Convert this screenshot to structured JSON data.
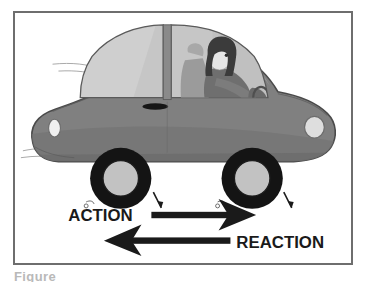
{
  "figure": {
    "caption_partial": "Figure",
    "frame": {
      "border_color": "#6e6e6e",
      "background_color": "#ffffff"
    }
  },
  "palette": {
    "body_gray": "#808080",
    "body_shadow_gray": "#6f6f6f",
    "body_outline": "#4a4a4a",
    "roof_gray": "#8a8a8a",
    "glass_gray": "#c8c8c8",
    "glass_dark_gray": "#b4b4b4",
    "tire_black": "#141414",
    "hub_gray": "#c0c0c0",
    "lamp_light": "#e4e4e4",
    "arrow_black": "#1a1a1a",
    "hair_dark": "#3a3a3a",
    "skin_light": "#e6e6e6",
    "seat_gray": "#9a9a9a",
    "text_black": "#1a1a1a"
  },
  "scene": {
    "vehicle": {
      "name": "car",
      "view": "side-profile-facing-right",
      "parts": [
        "body",
        "roof",
        "rear-window",
        "front-window",
        "b-pillar",
        "door-handle",
        "front-headlight",
        "rear-taillight",
        "rear-wheel",
        "front-wheel",
        "motion-streaks"
      ]
    },
    "driver": {
      "name": "driver",
      "description": "female driver with dark shoulder-length hair holding steering wheel",
      "parts": [
        "head",
        "hair",
        "torso",
        "arm",
        "seat",
        "headrest",
        "steering-wheel"
      ]
    },
    "wheels": [
      {
        "name": "rear-wheel",
        "cx": 107,
        "cy": 168,
        "tire_r": 31,
        "hub_r": 18,
        "spin_arrow": "clockwise"
      },
      {
        "name": "front-wheel",
        "cx": 240,
        "cy": 168,
        "tire_r": 31,
        "hub_r": 18,
        "spin_arrow": "clockwise"
      }
    ]
  },
  "annotations": {
    "action": {
      "label": "ACTION",
      "direction": "right",
      "description": "Force the tires exert backward on the road, drawn pointing forward",
      "label_x": 67,
      "label_y": 212,
      "shaft_start_x": 150,
      "shaft_end_x": 228,
      "tip_x": 250,
      "y": 207
    },
    "reaction": {
      "label": "REACTION",
      "direction": "left",
      "description": "Road pushes the car forward; arrow drawn pointing backward",
      "label_x": 236,
      "label_y": 238,
      "shaft_start_x": 228,
      "shaft_end_x": 145,
      "tip_x": 93,
      "y": 233
    }
  }
}
